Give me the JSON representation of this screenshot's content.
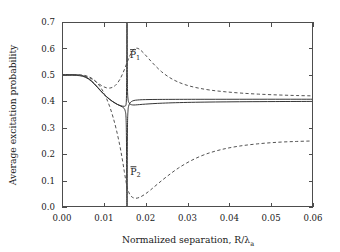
{
  "chart_data": {
    "type": "line",
    "title": "",
    "xlabel": "Normalized separation, R/λ",
    "xlabel_sub": "a",
    "ylabel": "Average excitation probability",
    "xlim": [
      0.0,
      0.06
    ],
    "ylim": [
      0.0,
      0.7
    ],
    "xticks": [
      0.0,
      0.01,
      0.02,
      0.03,
      0.04,
      0.05,
      0.06
    ],
    "xtick_labels": [
      "0.00",
      "0.01",
      "0.02",
      "0.03",
      "0.04",
      "0.05",
      "0.06"
    ],
    "yticks": [
      0.0,
      0.1,
      0.2,
      0.3,
      0.4,
      0.5,
      0.6,
      0.7
    ],
    "ytick_labels": [
      "0.0",
      "0.1",
      "0.2",
      "0.3",
      "0.4",
      "0.5",
      "0.6",
      "0.7"
    ],
    "grid": false,
    "legend_position": "none",
    "annotations": [
      {
        "text": "P",
        "sub": "1",
        "overbar": true,
        "x": 0.0162,
        "y": 0.565,
        "name": "curve-label-p1"
      },
      {
        "text": "P",
        "sub": "2",
        "overbar": true,
        "x": 0.0163,
        "y": 0.122,
        "name": "curve-label-p2"
      }
    ],
    "resonance_x": 0.0155,
    "series": [
      {
        "name": "P1-solid",
        "style": "solid",
        "points": [
          [
            0.0,
            0.4985
          ],
          [
            0.0012,
            0.4985
          ],
          [
            0.0024,
            0.4984
          ],
          [
            0.0034,
            0.498
          ],
          [
            0.0042,
            0.4968
          ],
          [
            0.005,
            0.4944
          ],
          [
            0.0057,
            0.49
          ],
          [
            0.0064,
            0.4836
          ],
          [
            0.0071,
            0.4748
          ],
          [
            0.0078,
            0.464
          ],
          [
            0.0085,
            0.452
          ],
          [
            0.0092,
            0.4398
          ],
          [
            0.0099,
            0.4282
          ],
          [
            0.0106,
            0.4176
          ],
          [
            0.0113,
            0.4082
          ],
          [
            0.012,
            0.4
          ],
          [
            0.0127,
            0.393
          ],
          [
            0.0133,
            0.3878
          ],
          [
            0.0139,
            0.384
          ],
          [
            0.0144,
            0.3818
          ],
          [
            0.0148,
            0.381
          ],
          [
            0.0151,
            0.382
          ],
          [
            0.0153,
            0.387
          ],
          [
            0.0154,
            0.41
          ],
          [
            0.01545,
            0.47
          ],
          [
            0.01548,
            0.56
          ],
          [
            0.0155,
            0.7
          ]
        ]
      },
      {
        "name": "P1-solid-right",
        "style": "solid",
        "points": [
          [
            0.01558,
            0.7
          ],
          [
            0.01562,
            0.5
          ],
          [
            0.01568,
            0.432
          ],
          [
            0.01578,
            0.409
          ],
          [
            0.0159,
            0.399
          ],
          [
            0.0162,
            0.3905
          ],
          [
            0.0166,
            0.387
          ],
          [
            0.0172,
            0.386
          ],
          [
            0.018,
            0.3868
          ],
          [
            0.0192,
            0.3884
          ],
          [
            0.0208,
            0.3902
          ],
          [
            0.0228,
            0.392
          ],
          [
            0.0255,
            0.3938
          ],
          [
            0.029,
            0.3954
          ],
          [
            0.033,
            0.3966
          ],
          [
            0.038,
            0.3976
          ],
          [
            0.044,
            0.3984
          ],
          [
            0.051,
            0.399
          ],
          [
            0.06,
            0.3995
          ]
        ]
      },
      {
        "name": "P2-solid",
        "style": "solid",
        "points": [
          [
            0.0,
            0.501
          ],
          [
            0.0012,
            0.501
          ],
          [
            0.0024,
            0.5009
          ],
          [
            0.0034,
            0.5005
          ],
          [
            0.0042,
            0.4993
          ],
          [
            0.005,
            0.4968
          ],
          [
            0.0057,
            0.4922
          ],
          [
            0.0064,
            0.4856
          ],
          [
            0.0071,
            0.4766
          ],
          [
            0.0078,
            0.4656
          ],
          [
            0.0085,
            0.4534
          ],
          [
            0.0092,
            0.441
          ],
          [
            0.0099,
            0.4292
          ],
          [
            0.0106,
            0.4184
          ],
          [
            0.0113,
            0.4088
          ],
          [
            0.012,
            0.4004
          ],
          [
            0.0127,
            0.3932
          ],
          [
            0.0133,
            0.3876
          ],
          [
            0.0139,
            0.383
          ],
          [
            0.0144,
            0.379
          ],
          [
            0.0148,
            0.374
          ],
          [
            0.0151,
            0.364
          ],
          [
            0.0153,
            0.34
          ],
          [
            0.0154,
            0.27
          ],
          [
            0.01545,
            0.15
          ],
          [
            0.01548,
            0.06
          ],
          [
            0.0155,
            0.0
          ]
        ]
      },
      {
        "name": "P2-solid-right",
        "style": "solid",
        "points": [
          [
            0.01558,
            0.0
          ],
          [
            0.01562,
            0.23
          ],
          [
            0.01568,
            0.328
          ],
          [
            0.01578,
            0.364
          ],
          [
            0.0159,
            0.38
          ],
          [
            0.0162,
            0.392
          ],
          [
            0.0166,
            0.399
          ],
          [
            0.0172,
            0.403
          ],
          [
            0.018,
            0.4048
          ],
          [
            0.0192,
            0.406
          ],
          [
            0.0208,
            0.4066
          ],
          [
            0.0228,
            0.407
          ],
          [
            0.0255,
            0.4072
          ],
          [
            0.029,
            0.4074
          ],
          [
            0.033,
            0.4075
          ],
          [
            0.038,
            0.4076
          ],
          [
            0.044,
            0.4077
          ],
          [
            0.051,
            0.4078
          ],
          [
            0.06,
            0.4078
          ]
        ]
      },
      {
        "name": "P1-dashed",
        "style": "dashed",
        "points": [
          [
            0.0,
            0.499
          ],
          [
            0.0014,
            0.499
          ],
          [
            0.0028,
            0.4988
          ],
          [
            0.004,
            0.4982
          ],
          [
            0.005,
            0.4966
          ],
          [
            0.0058,
            0.4938
          ],
          [
            0.0066,
            0.489
          ],
          [
            0.0074,
            0.482
          ],
          [
            0.0082,
            0.473
          ],
          [
            0.009,
            0.464
          ],
          [
            0.0098,
            0.4562
          ],
          [
            0.0106,
            0.4512
          ],
          [
            0.0114,
            0.45
          ],
          [
            0.0122,
            0.454
          ],
          [
            0.013,
            0.464
          ],
          [
            0.0138,
            0.482
          ],
          [
            0.0146,
            0.508
          ],
          [
            0.0154,
            0.54
          ],
          [
            0.0162,
            0.572
          ],
          [
            0.017,
            0.594
          ],
          [
            0.0178,
            0.601
          ],
          [
            0.0186,
            0.596
          ],
          [
            0.0196,
            0.581
          ],
          [
            0.0208,
            0.56
          ],
          [
            0.0222,
            0.536
          ],
          [
            0.0238,
            0.512
          ],
          [
            0.0256,
            0.491
          ],
          [
            0.0276,
            0.474
          ],
          [
            0.03,
            0.46
          ],
          [
            0.0326,
            0.45
          ],
          [
            0.0356,
            0.442
          ],
          [
            0.039,
            0.436
          ],
          [
            0.0428,
            0.431
          ],
          [
            0.047,
            0.427
          ],
          [
            0.0516,
            0.424
          ],
          [
            0.056,
            0.4218
          ],
          [
            0.06,
            0.4205
          ]
        ]
      },
      {
        "name": "P2-dashed",
        "style": "dashed",
        "points": [
          [
            0.0,
            0.5005
          ],
          [
            0.0014,
            0.5005
          ],
          [
            0.0028,
            0.5004
          ],
          [
            0.004,
            0.5
          ],
          [
            0.005,
            0.4988
          ],
          [
            0.0058,
            0.4964
          ],
          [
            0.0066,
            0.4916
          ],
          [
            0.0074,
            0.484
          ],
          [
            0.0082,
            0.473
          ],
          [
            0.009,
            0.458
          ],
          [
            0.0098,
            0.438
          ],
          [
            0.0106,
            0.412
          ],
          [
            0.0114,
            0.38
          ],
          [
            0.0122,
            0.34
          ],
          [
            0.013,
            0.292
          ],
          [
            0.0138,
            0.234
          ],
          [
            0.0144,
            0.182
          ],
          [
            0.0149,
            0.134
          ],
          [
            0.0153,
            0.096
          ],
          [
            0.0157,
            0.068
          ],
          [
            0.0162,
            0.048
          ],
          [
            0.0168,
            0.037
          ],
          [
            0.0176,
            0.033
          ],
          [
            0.0186,
            0.037
          ],
          [
            0.0198,
            0.048
          ],
          [
            0.0212,
            0.065
          ],
          [
            0.023,
            0.089
          ],
          [
            0.0252,
            0.117
          ],
          [
            0.0278,
            0.147
          ],
          [
            0.0308,
            0.175
          ],
          [
            0.0342,
            0.199
          ],
          [
            0.038,
            0.217
          ],
          [
            0.0422,
            0.23
          ],
          [
            0.0468,
            0.239
          ],
          [
            0.0516,
            0.245
          ],
          [
            0.056,
            0.248
          ],
          [
            0.06,
            0.25
          ]
        ]
      }
    ]
  }
}
